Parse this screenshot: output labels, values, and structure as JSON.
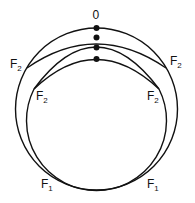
{
  "diagram": {
    "colors": {
      "stroke": "#111111",
      "background": "#ffffff"
    },
    "top_label": "0",
    "labels": {
      "f2_outer_left": {
        "main": "F",
        "sub": "2"
      },
      "f2_outer_right": {
        "main": "F",
        "sub": "2"
      },
      "f2_inner_left": {
        "main": "F",
        "sub": "2"
      },
      "f2_inner_right": {
        "main": "F",
        "sub": "2"
      },
      "f1_left": {
        "main": "F",
        "sub": "1"
      },
      "f1_right": {
        "main": "F",
        "sub": "1"
      }
    },
    "dots": 4
  }
}
